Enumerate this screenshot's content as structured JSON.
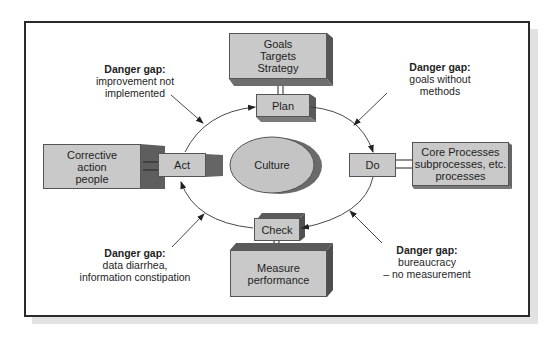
{
  "diagram": {
    "center": {
      "label": "Culture"
    },
    "cycle": [
      {
        "id": "plan",
        "label": "Plan"
      },
      {
        "id": "do",
        "label": "Do"
      },
      {
        "id": "check",
        "label": "Check"
      },
      {
        "id": "act",
        "label": "Act"
      }
    ],
    "attached": {
      "plan": "Goals\nTargets\nStrategy",
      "do": "Core Processes\nsubprocesses, etc.\nprocesses",
      "check": "Measure\nperformance",
      "act": "Corrective\naction\npeople"
    },
    "danger_gaps": [
      {
        "position": "top-left",
        "title": "Danger gap:",
        "text": "improvement not\nimplemented"
      },
      {
        "position": "top-right",
        "title": "Danger gap:",
        "text": "goals without\nmethods"
      },
      {
        "position": "bottom-left",
        "title": "Danger gap:",
        "text": "data diarrhea,\ninformation constipation"
      },
      {
        "position": "bottom-right",
        "title": "Danger gap:",
        "text": "bureaucracy\n– no measurement"
      }
    ],
    "colors": {
      "box_face": "#c9c9c9",
      "box_dark": "#6e6e6e",
      "frame": "#2a2a2a",
      "frame_shadow": "#e2e2e2"
    }
  }
}
